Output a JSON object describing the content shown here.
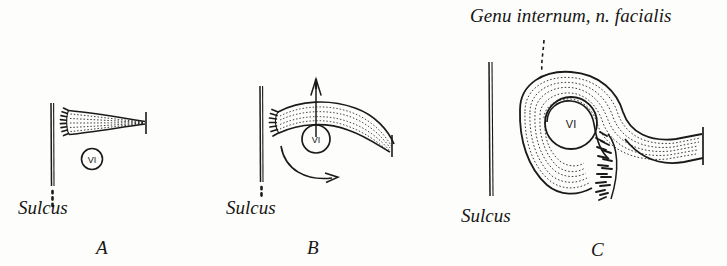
{
  "figure": {
    "name": "genu-internum-development",
    "background_color": "#fdfdfb",
    "ink_color": "#1a1a18",
    "annotation_label": "Genu internum, n. facialis"
  },
  "panels": [
    {
      "letter": "A",
      "sulcus_label": "Sulcus",
      "nucleus_label": "VI",
      "has_dotted_sulcus_extension": true,
      "has_up_arrow": false,
      "has_rotation_arrow": false,
      "has_title_leader": false,
      "description": "Straight fan-shaped facial nerve bundle lateral to sulcus, abducens nucleus below"
    },
    {
      "letter": "B",
      "sulcus_label": "Sulcus",
      "nucleus_label": "VI",
      "has_dotted_sulcus_extension": true,
      "has_up_arrow": true,
      "has_rotation_arrow": true,
      "has_title_leader": false,
      "description": "Nerve bundle arching over abducens nucleus, arrows indicate upward growth and rotation"
    },
    {
      "letter": "C",
      "sulcus_label": "Sulcus",
      "nucleus_label": "VI",
      "has_dotted_sulcus_extension": false,
      "has_up_arrow": false,
      "has_rotation_arrow": false,
      "has_title_leader": true,
      "description": "Completed internal genu looping fully around abducens nucleus with descending brush terminal"
    }
  ]
}
